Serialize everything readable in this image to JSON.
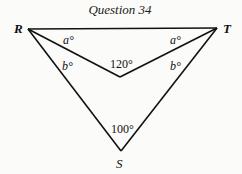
{
  "title": "Question 34",
  "vertices": {
    "R": "R",
    "T": "T",
    "S": "S"
  },
  "angles": {
    "angle_R_top": "a°",
    "angle_T_top": "a°",
    "angle_R_bottom": "b°",
    "angle_T_bottom": "b°",
    "inner_angle": "120°",
    "angle_S": "100°"
  },
  "colors": {
    "line": "#111111",
    "background": "#fbfbf9"
  }
}
